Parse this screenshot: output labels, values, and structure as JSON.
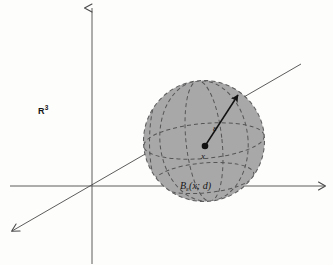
{
  "figure": {
    "background_color": "#fdfdfc",
    "sphere_fill_color": "#a8a8a8",
    "line_color": "#4a4a4a",
    "dash_color": "#5a5a5a",
    "ink_color": "#151515"
  },
  "labels": {
    "space": "R",
    "space_exponent": "3",
    "radius": "ε",
    "center_point": "x",
    "ball_name": "B",
    "ball_subscript": "ε",
    "ball_args": "(x; d)"
  },
  "geometry": {
    "origin": {
      "x": 92,
      "y": 186
    },
    "sphere": {
      "cx": 204,
      "cy": 141,
      "r": 61
    },
    "center_dot": {
      "x": 205,
      "y": 146,
      "r": 3.2
    },
    "radius_arrow_tip": {
      "x": 238,
      "y": 94
    },
    "axes": [
      {
        "name": "vertical-axis",
        "x1": 92,
        "y1": 264,
        "x2": 92,
        "y2": 8,
        "arrow": "end"
      },
      {
        "name": "horizontal-axis",
        "x1": 10,
        "y1": 186,
        "x2": 325,
        "y2": 186,
        "arrow": "end"
      },
      {
        "name": "depth-axis",
        "x1": 12,
        "y1": 231,
        "x2": 301,
        "y2": 64,
        "arrow": "start"
      }
    ]
  }
}
